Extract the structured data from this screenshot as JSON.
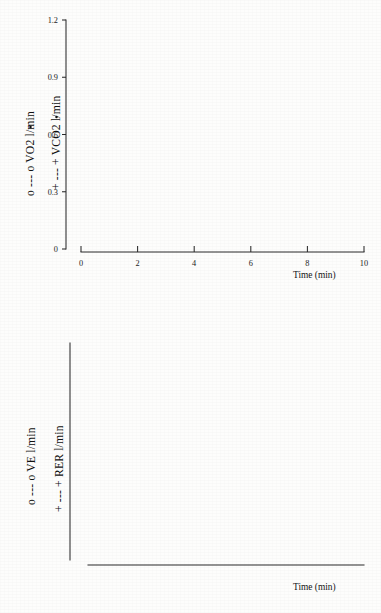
{
  "figure": {
    "type": "scanned-scientific-figure",
    "panel_count": 2,
    "background_color": "#fdfdfc",
    "ink_color": "#181818"
  },
  "panels": [
    {
      "id": "top",
      "x_axis": {
        "label": "Time (min)",
        "ticks": [
          "0",
          "2",
          "4",
          "6",
          "8",
          "10"
        ],
        "min": 0,
        "max": 10
      },
      "y_axis_primary": {
        "ticks": [
          "0",
          "0.3",
          "0.6",
          "0.9",
          "1.2"
        ],
        "min": 0,
        "max": 1.2,
        "unit": "l/min"
      },
      "series_labels": [
        "o --- o VO2  l/min",
        "+ --- + VCO2  l/min"
      ]
    },
    {
      "id": "bottom",
      "x_axis": {
        "label": "Time (min)",
        "ticks": [
          "0",
          "2",
          "4",
          "6",
          "8",
          "10"
        ],
        "min": 0,
        "max": 10
      },
      "y_axis_primary": {
        "ticks": [
          "0",
          "20",
          "40",
          "60"
        ],
        "min": 0,
        "max": 60,
        "unit": "l/min"
      },
      "y_axis_secondary": {
        "ticks": [
          "0.5",
          "1.0",
          "1.5"
        ],
        "min": 0.5,
        "max": 1.5,
        "unit": ""
      },
      "series_labels": [
        "o --- o VE l/min",
        "+ --- + RER  l/min"
      ]
    }
  ],
  "chart_data": [
    {
      "type": "line",
      "title": "",
      "subtitle": "",
      "xlabel": "Time (min)",
      "ylabel": "VO2 / VCO2  (l/min)",
      "xlim": [
        0,
        10
      ],
      "ylim": [
        0,
        1.2
      ],
      "xticks": [
        0,
        2,
        4,
        6,
        8,
        10
      ],
      "yticks": [
        0,
        0.3,
        0.6,
        0.9,
        1.2
      ],
      "grid": false,
      "legend_position": "axis-labels-rotated-left",
      "annotations": [],
      "series": [
        {
          "name": "VO2",
          "marker": "open-square",
          "linestyle": "dashed",
          "legend": "o --- o VO2  l/min",
          "x": [
            0.05,
            0.2,
            0.35,
            0.5,
            0.7,
            0.9,
            1.1,
            1.25,
            1.45,
            1.6,
            1.8,
            2.0,
            2.2,
            2.35,
            2.55,
            2.75,
            2.95,
            3.15,
            3.35,
            3.55,
            3.75,
            3.95,
            4.15,
            4.4,
            4.65,
            4.9,
            5.1,
            5.3,
            5.45,
            5.6,
            5.8,
            6.0,
            6.2,
            6.4,
            6.6,
            6.8,
            7.0,
            7.2,
            7.4,
            7.6,
            7.8,
            8.0,
            8.2,
            8.4,
            8.6,
            8.8,
            9.0,
            9.2,
            9.35,
            9.55
          ],
          "y": [
            0.155,
            0.09,
            0.035,
            0.055,
            0.09,
            0.115,
            0.165,
            0.275,
            0.275,
            0.265,
            0.245,
            0.215,
            0.185,
            0.16,
            0.135,
            0.145,
            0.175,
            0.215,
            0.285,
            0.315,
            0.33,
            0.335,
            0.325,
            0.305,
            0.295,
            0.295,
            0.305,
            0.265,
            0.23,
            0.33,
            0.42,
            0.505,
            0.47,
            0.465,
            0.465,
            0.47,
            0.48,
            0.485,
            0.505,
            0.51,
            0.535,
            0.555,
            0.58,
            0.615,
            0.565,
            0.59,
            0.61,
            0.63,
            0.635,
            0.615
          ]
        },
        {
          "name": "VCO2",
          "marker": "plus",
          "linestyle": "dashed",
          "legend": "+ --- + VCO2  l/min",
          "x": [
            0.18,
            0.3,
            0.45,
            0.62,
            0.8,
            1.0,
            1.18,
            1.35,
            1.5,
            1.7,
            1.9,
            2.1,
            2.3,
            2.5,
            2.7,
            2.9,
            3.1,
            3.3,
            3.5,
            3.7,
            3.9,
            4.05,
            4.25,
            4.5,
            4.75,
            5.0,
            5.2,
            5.4,
            5.55,
            5.75,
            5.95,
            6.15,
            6.35,
            6.55,
            6.75,
            6.95,
            7.15,
            7.35,
            7.55,
            7.75,
            7.95,
            8.15,
            8.35,
            8.55,
            8.7,
            8.85,
            9.0,
            9.15,
            9.3,
            9.45,
            9.6
          ],
          "y": [
            0.075,
            0.04,
            0.06,
            0.085,
            0.115,
            0.19,
            0.265,
            0.285,
            0.27,
            0.25,
            0.225,
            0.195,
            0.165,
            0.14,
            0.15,
            0.185,
            0.225,
            0.29,
            0.32,
            0.345,
            0.375,
            0.41,
            0.385,
            0.35,
            0.315,
            0.305,
            0.275,
            0.245,
            0.32,
            0.45,
            0.555,
            0.59,
            0.625,
            0.655,
            0.665,
            0.69,
            0.705,
            0.725,
            0.735,
            0.75,
            0.765,
            0.775,
            0.79,
            0.73,
            0.675,
            0.715,
            0.77,
            0.83,
            0.875,
            0.835,
            0.81
          ]
        }
      ]
    },
    {
      "type": "line",
      "title": "",
      "subtitle": "",
      "xlabel": "Time (min)",
      "ylabel": "VE (l/min) / RER",
      "xlim": [
        0,
        10
      ],
      "ylim": [
        0,
        60
      ],
      "ylim_secondary": [
        0.5,
        1.5
      ],
      "xticks": [
        0,
        2,
        4,
        6,
        8,
        10
      ],
      "yticks": [
        0,
        20,
        40,
        60
      ],
      "yticks_secondary": [
        0.5,
        1.0,
        1.5
      ],
      "grid": false,
      "legend_position": "axis-labels-rotated-left",
      "annotations": [],
      "series": [
        {
          "name": "VE",
          "axis": "left",
          "marker": "open-square",
          "linestyle": "dashed",
          "legend": "o --- o VE l/min",
          "x": [
            0.15,
            0.3,
            0.45,
            0.6,
            0.8,
            1.0,
            1.2,
            1.4,
            1.6,
            1.8,
            2.0,
            2.2,
            2.4,
            2.6,
            2.8,
            3.0,
            3.2,
            3.4,
            3.6,
            3.8,
            4.0,
            4.2,
            4.4,
            4.6,
            4.8,
            5.0,
            5.2,
            5.4,
            5.6,
            5.8,
            6.0,
            6.2,
            6.4,
            6.6,
            6.8,
            7.0,
            7.2,
            7.4,
            7.6,
            7.8,
            8.0,
            8.2,
            8.4,
            8.6,
            8.8,
            9.0,
            9.2,
            9.35,
            9.5,
            9.65
          ],
          "y": [
            3.5,
            2.0,
            3.8,
            5.5,
            8.0,
            11.0,
            13.0,
            14.0,
            15.2,
            14.8,
            14.0,
            12.2,
            10.0,
            8.4,
            8.6,
            10.5,
            13.5,
            16.5,
            19.5,
            22.0,
            24.0,
            26.0,
            25.0,
            22.5,
            19.5,
            16.0,
            13.0,
            13.0,
            16.5,
            22.0,
            29.0,
            35.0,
            39.5,
            40.5,
            39.5,
            39.5,
            39.8,
            40.2,
            40.5,
            41.0,
            41.5,
            41.0,
            38.5,
            36.5,
            39.5,
            44.0,
            48.0,
            51.5,
            47.5,
            44.0
          ]
        },
        {
          "name": "RER",
          "axis": "right",
          "marker": "plus",
          "linestyle": "solid",
          "legend": "+ --- + RER  l/min",
          "x": [
            0.1,
            0.3,
            0.5,
            0.7,
            0.9,
            1.1,
            1.3,
            1.5,
            1.7,
            1.9,
            2.05,
            2.25,
            2.45,
            2.65,
            2.85,
            3.05,
            3.25,
            3.45,
            3.65,
            3.85,
            4.05,
            4.25,
            4.45,
            4.65,
            4.85,
            5.05,
            5.25,
            5.45,
            5.65,
            5.85,
            6.05,
            6.25,
            6.45,
            6.65,
            6.85,
            7.05,
            7.25,
            7.45,
            7.65,
            7.85,
            8.05,
            8.25,
            8.45,
            8.65,
            8.85,
            9.05,
            9.25,
            9.45,
            9.6
          ],
          "y": [
            0.835,
            0.805,
            0.775,
            0.755,
            0.748,
            0.752,
            0.765,
            0.8,
            0.845,
            0.878,
            0.885,
            0.878,
            0.858,
            0.828,
            0.805,
            0.8,
            0.812,
            0.832,
            0.862,
            0.9,
            0.945,
            0.985,
            0.958,
            0.915,
            0.862,
            0.818,
            0.8,
            0.798,
            0.822,
            0.875,
            0.945,
            1.015,
            1.062,
            1.082,
            1.088,
            1.082,
            1.072,
            1.062,
            1.052,
            1.045,
            1.042,
            1.035,
            1.012,
            0.995,
            1.022,
            1.055,
            1.032,
            1.045,
            1.028
          ]
        }
      ]
    }
  ]
}
